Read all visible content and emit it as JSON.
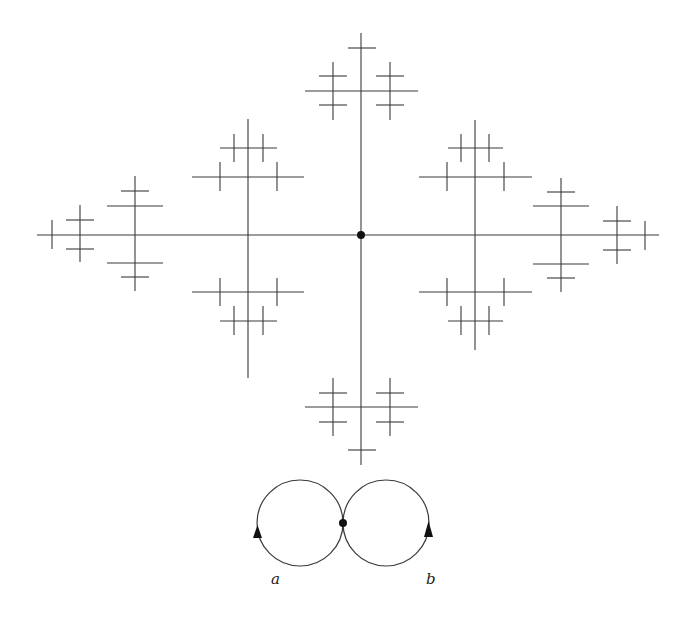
{
  "figure": {
    "stroke_color": "#3a3a3a",
    "tree": {
      "origin": {
        "x": 361,
        "y": 235,
        "r": 4
      },
      "segments": [
        {
          "x1": 37,
          "y1": 235,
          "x2": 659,
          "y2": 235
        },
        {
          "x1": 361,
          "y1": 33,
          "x2": 361,
          "y2": 465
        },
        {
          "x1": 348,
          "y1": 48,
          "x2": 376,
          "y2": 48
        },
        {
          "x1": 305,
          "y1": 91,
          "x2": 418,
          "y2": 91
        },
        {
          "x1": 333,
          "y1": 62,
          "x2": 333,
          "y2": 120
        },
        {
          "x1": 390,
          "y1": 62,
          "x2": 390,
          "y2": 120
        },
        {
          "x1": 319,
          "y1": 76,
          "x2": 347,
          "y2": 76
        },
        {
          "x1": 319,
          "y1": 105,
          "x2": 347,
          "y2": 105
        },
        {
          "x1": 376,
          "y1": 76,
          "x2": 404,
          "y2": 76
        },
        {
          "x1": 376,
          "y1": 105,
          "x2": 404,
          "y2": 105
        },
        {
          "x1": 305,
          "y1": 407,
          "x2": 418,
          "y2": 407
        },
        {
          "x1": 348,
          "y1": 450,
          "x2": 376,
          "y2": 450
        },
        {
          "x1": 333,
          "y1": 378,
          "x2": 333,
          "y2": 436
        },
        {
          "x1": 390,
          "y1": 378,
          "x2": 390,
          "y2": 436
        },
        {
          "x1": 319,
          "y1": 393,
          "x2": 347,
          "y2": 393
        },
        {
          "x1": 319,
          "y1": 422,
          "x2": 347,
          "y2": 422
        },
        {
          "x1": 376,
          "y1": 393,
          "x2": 404,
          "y2": 393
        },
        {
          "x1": 376,
          "y1": 422,
          "x2": 404,
          "y2": 422
        },
        {
          "x1": 248,
          "y1": 119,
          "x2": 248,
          "y2": 378
        },
        {
          "x1": 220,
          "y1": 148,
          "x2": 277,
          "y2": 148
        },
        {
          "x1": 192,
          "y1": 177,
          "x2": 304,
          "y2": 177
        },
        {
          "x1": 234,
          "y1": 134,
          "x2": 234,
          "y2": 162
        },
        {
          "x1": 263,
          "y1": 134,
          "x2": 263,
          "y2": 162
        },
        {
          "x1": 220,
          "y1": 162,
          "x2": 220,
          "y2": 191
        },
        {
          "x1": 277,
          "y1": 162,
          "x2": 277,
          "y2": 191
        },
        {
          "x1": 192,
          "y1": 292,
          "x2": 304,
          "y2": 292
        },
        {
          "x1": 220,
          "y1": 321,
          "x2": 277,
          "y2": 321
        },
        {
          "x1": 220,
          "y1": 278,
          "x2": 220,
          "y2": 306
        },
        {
          "x1": 277,
          "y1": 278,
          "x2": 277,
          "y2": 306
        },
        {
          "x1": 234,
          "y1": 306,
          "x2": 234,
          "y2": 335
        },
        {
          "x1": 263,
          "y1": 306,
          "x2": 263,
          "y2": 335
        },
        {
          "x1": 475,
          "y1": 120,
          "x2": 475,
          "y2": 350
        },
        {
          "x1": 448,
          "y1": 148,
          "x2": 503,
          "y2": 148
        },
        {
          "x1": 419,
          "y1": 177,
          "x2": 532,
          "y2": 177
        },
        {
          "x1": 461,
          "y1": 134,
          "x2": 461,
          "y2": 162
        },
        {
          "x1": 489,
          "y1": 134,
          "x2": 489,
          "y2": 162
        },
        {
          "x1": 447,
          "y1": 162,
          "x2": 447,
          "y2": 191
        },
        {
          "x1": 504,
          "y1": 162,
          "x2": 504,
          "y2": 191
        },
        {
          "x1": 419,
          "y1": 292,
          "x2": 532,
          "y2": 292
        },
        {
          "x1": 448,
          "y1": 321,
          "x2": 503,
          "y2": 321
        },
        {
          "x1": 447,
          "y1": 278,
          "x2": 447,
          "y2": 306
        },
        {
          "x1": 504,
          "y1": 278,
          "x2": 504,
          "y2": 306
        },
        {
          "x1": 461,
          "y1": 306,
          "x2": 461,
          "y2": 335
        },
        {
          "x1": 489,
          "y1": 306,
          "x2": 489,
          "y2": 335
        },
        {
          "x1": 135,
          "y1": 176,
          "x2": 135,
          "y2": 291
        },
        {
          "x1": 107,
          "y1": 206,
          "x2": 163,
          "y2": 206
        },
        {
          "x1": 107,
          "y1": 263,
          "x2": 163,
          "y2": 263
        },
        {
          "x1": 121,
          "y1": 191,
          "x2": 149,
          "y2": 191
        },
        {
          "x1": 121,
          "y1": 277,
          "x2": 149,
          "y2": 277
        },
        {
          "x1": 80,
          "y1": 205,
          "x2": 80,
          "y2": 262
        },
        {
          "x1": 66,
          "y1": 220,
          "x2": 94,
          "y2": 220
        },
        {
          "x1": 66,
          "y1": 249,
          "x2": 94,
          "y2": 249
        },
        {
          "x1": 52,
          "y1": 220,
          "x2": 52,
          "y2": 249
        },
        {
          "x1": 561,
          "y1": 178,
          "x2": 561,
          "y2": 292
        },
        {
          "x1": 533,
          "y1": 206,
          "x2": 589,
          "y2": 206
        },
        {
          "x1": 533,
          "y1": 264,
          "x2": 589,
          "y2": 264
        },
        {
          "x1": 547,
          "y1": 192,
          "x2": 575,
          "y2": 192
        },
        {
          "x1": 547,
          "y1": 278,
          "x2": 575,
          "y2": 278
        },
        {
          "x1": 617,
          "y1": 206,
          "x2": 617,
          "y2": 264
        },
        {
          "x1": 603,
          "y1": 221,
          "x2": 631,
          "y2": 221
        },
        {
          "x1": 603,
          "y1": 250,
          "x2": 631,
          "y2": 250
        },
        {
          "x1": 645,
          "y1": 221,
          "x2": 645,
          "y2": 250
        }
      ]
    },
    "rose": {
      "circles": [
        {
          "name": "loop-a",
          "cx": 300,
          "cy": 523,
          "r": 43
        },
        {
          "name": "loop-b",
          "cx": 386,
          "cy": 523,
          "r": 43
        }
      ],
      "basepoint": {
        "x": 343,
        "y": 523,
        "r": 4
      },
      "arrows": [
        {
          "name": "arrow-a",
          "points": "257.5,525 253,538 262,538"
        },
        {
          "name": "arrow-b",
          "points": "428.5,521 424,537 433,537"
        }
      ],
      "labels": [
        {
          "name": "label-a",
          "text": "a",
          "x": 271,
          "y": 584
        },
        {
          "name": "label-b",
          "text": "b",
          "x": 426,
          "y": 584
        }
      ]
    }
  }
}
